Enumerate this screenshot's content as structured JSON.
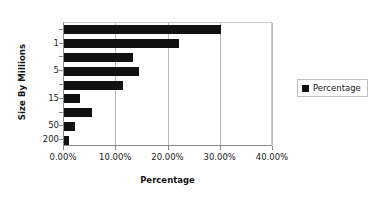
{
  "chart_data": {
    "type": "bar",
    "orientation": "horizontal",
    "title": "",
    "xlabel": "Percentage",
    "ylabel": "Size By Millions",
    "xlim": [
      0,
      0.4
    ],
    "xtick_labels": [
      "0.00%",
      "10.00%",
      "20.00%",
      "30.00%",
      "40.00%"
    ],
    "xtick_values": [
      0,
      0.1,
      0.2,
      0.3,
      0.4
    ],
    "ytick_labels_visible": [
      "1",
      "5",
      "15",
      "50",
      "200"
    ],
    "grid": true,
    "legend": {
      "position": "right",
      "entries": [
        {
          "name": "Percentage",
          "color": "#111111"
        }
      ]
    },
    "series": [
      {
        "name": "Percentage",
        "color": "#111111",
        "categories": [
          "",
          "1",
          "",
          "5",
          "",
          "15",
          "",
          "50",
          "",
          "200"
        ],
        "bars": [
          {
            "label": "",
            "value": 0.3
          },
          {
            "label": "1",
            "value": 0.22
          },
          {
            "label": "",
            "value": 0.132
          },
          {
            "label": "5",
            "value": 0.144
          },
          {
            "label": "",
            "value": 0.113
          },
          {
            "label": "15",
            "value": 0.031
          },
          {
            "label": "",
            "value": 0.054
          },
          {
            "label": "50",
            "value": 0.021
          },
          {
            "label": "200",
            "value": 0.009
          }
        ]
      }
    ]
  }
}
